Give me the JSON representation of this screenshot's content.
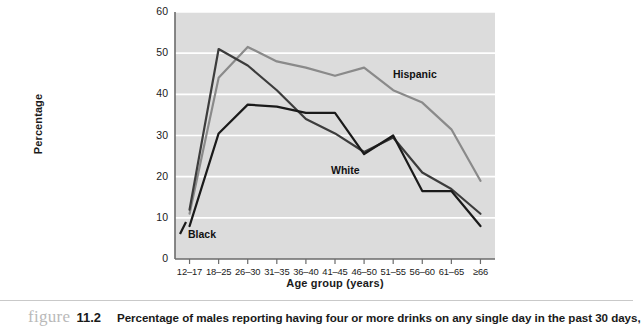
{
  "caption": {
    "figure_word": "figure",
    "number": "11.2",
    "text": "Percentage of males reporting having four or more drinks on any single day in the past 30 days,"
  },
  "chart_data": {
    "type": "line",
    "title": "",
    "xlabel": "Age group (years)",
    "ylabel": "Percentage",
    "categories": [
      "12–17",
      "18–25",
      "26–30",
      "31–35",
      "36–40",
      "41–45",
      "46–50",
      "51–55",
      "56–60",
      "61–65",
      "≥66"
    ],
    "ylim": [
      0,
      60
    ],
    "yticks": [
      0,
      10,
      20,
      30,
      40,
      50,
      60
    ],
    "grid": "horizontal",
    "legend_position": "inline-labels",
    "plot_background": "#dcdcdc",
    "series": [
      {
        "name": "Hispanic",
        "color": "#8a8a8a",
        "values": [
          11,
          44,
          51.5,
          48,
          46.5,
          44.5,
          46.5,
          41,
          38,
          31.5,
          19
        ]
      },
      {
        "name": "White",
        "color": "#3c3c3c",
        "values": [
          12,
          51,
          47,
          41,
          34,
          30.5,
          26,
          29.5,
          21,
          17,
          11
        ]
      },
      {
        "name": "Black",
        "color": "#1a1a1a",
        "values": [
          8,
          30.5,
          37.5,
          37,
          35.5,
          35.5,
          25.5,
          30,
          16.5,
          16.5,
          8
        ]
      }
    ],
    "annotations": [
      {
        "label": "Hispanic",
        "x": 393,
        "y": 68
      },
      {
        "label": "White",
        "x": 331,
        "y": 164
      },
      {
        "label": "Black",
        "x": 188,
        "y": 228
      }
    ]
  }
}
